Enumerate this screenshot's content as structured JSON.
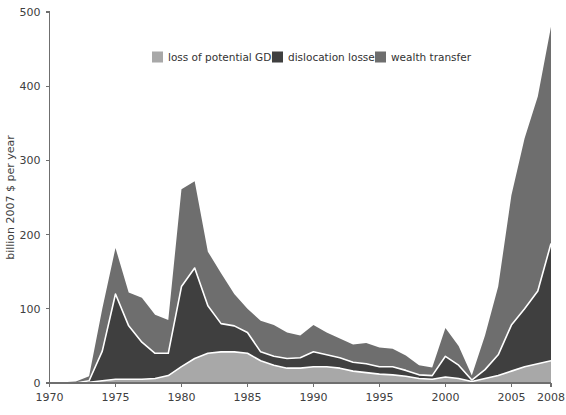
{
  "chart_data": {
    "type": "area",
    "stacked": true,
    "title": "",
    "xlabel": "",
    "ylabel": "billion 2007 $ per year",
    "xlim": [
      1970,
      2008
    ],
    "ylim": [
      0,
      500
    ],
    "yticks": [
      0,
      100,
      200,
      300,
      400,
      500
    ],
    "xticks": [
      1970,
      1975,
      1980,
      1985,
      1990,
      1995,
      2000,
      2005,
      2008
    ],
    "grid": false,
    "legend_position": "top-center",
    "x": [
      1970,
      1971,
      1972,
      1973,
      1974,
      1975,
      1976,
      1977,
      1978,
      1979,
      1980,
      1981,
      1982,
      1983,
      1984,
      1985,
      1986,
      1987,
      1988,
      1989,
      1990,
      1991,
      1992,
      1993,
      1994,
      1995,
      1996,
      1997,
      1998,
      1999,
      2000,
      2001,
      2002,
      2003,
      2004,
      2005,
      2006,
      2007,
      2008
    ],
    "series": [
      {
        "name": "loss of potential GDP",
        "color": "#a8a8a8",
        "values": [
          0,
          0,
          0,
          1,
          3,
          5,
          5,
          5,
          6,
          10,
          22,
          33,
          40,
          42,
          42,
          40,
          30,
          24,
          20,
          20,
          22,
          22,
          20,
          16,
          14,
          12,
          11,
          9,
          6,
          5,
          8,
          6,
          2,
          6,
          10,
          16,
          22,
          26,
          30
        ]
      },
      {
        "name": "dislocation losses",
        "color": "#3f3f3f",
        "values": [
          0,
          0,
          0,
          2,
          40,
          115,
          72,
          50,
          34,
          30,
          108,
          122,
          64,
          38,
          35,
          28,
          12,
          12,
          13,
          14,
          20,
          16,
          14,
          12,
          12,
          10,
          11,
          8,
          5,
          5,
          28,
          18,
          2,
          12,
          28,
          62,
          78,
          98,
          158
        ]
      },
      {
        "name": "wealth transfer",
        "color": "#6e6e6e",
        "values": [
          1,
          1,
          2,
          6,
          57,
          62,
          45,
          60,
          52,
          45,
          131,
          117,
          73,
          68,
          43,
          32,
          42,
          42,
          35,
          30,
          36,
          30,
          26,
          24,
          28,
          26,
          24,
          20,
          13,
          11,
          38,
          26,
          6,
          46,
          92,
          175,
          230,
          262,
          292
        ]
      }
    ],
    "totals_note": "stacked order bottom to top: loss of potential GDP, dislocation losses, wealth transfer"
  },
  "legend": {
    "items": [
      {
        "label": "loss of potential GDP",
        "color": "#a8a8a8"
      },
      {
        "label": "dislocation losses",
        "color": "#3f3f3f"
      },
      {
        "label": "wealth transfer",
        "color": "#6e6e6e"
      }
    ]
  },
  "axes": {
    "y_title": "billion 2007 $ per year",
    "y_tick_labels": [
      "0",
      "100",
      "200",
      "300",
      "400",
      "500"
    ],
    "x_tick_labels": [
      "1970",
      "1975",
      "1980",
      "1985",
      "1990",
      "1995",
      "2000",
      "2005",
      "2008"
    ]
  }
}
